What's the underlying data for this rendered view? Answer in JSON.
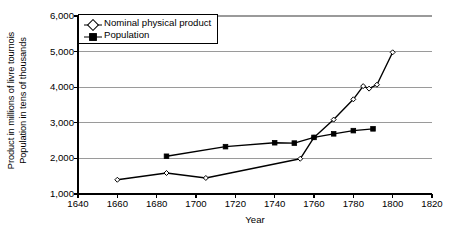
{
  "chart_data": {
    "type": "line",
    "title": "",
    "xlabel": "Year",
    "ylabel": "Product in millions of livre tournois / Population in tens of thousands",
    "ylabel_lines": [
      "Product in millions of livre tournois",
      "Population in tens of thousands"
    ],
    "xlim": [
      1640,
      1820
    ],
    "ylim": [
      1000,
      6000
    ],
    "xticks": [
      1640,
      1660,
      1680,
      1700,
      1720,
      1740,
      1760,
      1780,
      1800,
      1820
    ],
    "xtick_labels": [
      "1640",
      "1660",
      "1680",
      "1700",
      "1720",
      "1740",
      "1760",
      "1780",
      "1800",
      "1820"
    ],
    "yticks": [
      1000,
      2000,
      3000,
      4000,
      5000,
      6000
    ],
    "ytick_labels": [
      "1,000",
      "2,000",
      "3,000",
      "4,000",
      "5,000",
      "6,000"
    ],
    "grid": "horizontal",
    "legend_position": "top-left",
    "series": [
      {
        "name": "Nominal physical product",
        "marker": "open-diamond",
        "color": "#000000",
        "points": [
          {
            "x": 1660,
            "y": 1400
          },
          {
            "x": 1685,
            "y": 1590
          },
          {
            "x": 1705,
            "y": 1450
          },
          {
            "x": 1753,
            "y": 1990
          },
          {
            "x": 1760,
            "y": 2590
          },
          {
            "x": 1770,
            "y": 3090
          },
          {
            "x": 1780,
            "y": 3660
          },
          {
            "x": 1785,
            "y": 4030
          },
          {
            "x": 1788,
            "y": 3960
          },
          {
            "x": 1792,
            "y": 4070
          },
          {
            "x": 1800,
            "y": 4980
          }
        ]
      },
      {
        "name": "Population",
        "marker": "filled-square",
        "color": "#000000",
        "points": [
          {
            "x": 1685,
            "y": 2060
          },
          {
            "x": 1715,
            "y": 2330
          },
          {
            "x": 1740,
            "y": 2440
          },
          {
            "x": 1750,
            "y": 2430
          },
          {
            "x": 1760,
            "y": 2590
          },
          {
            "x": 1770,
            "y": 2690
          },
          {
            "x": 1780,
            "y": 2780
          },
          {
            "x": 1790,
            "y": 2830
          }
        ]
      }
    ]
  },
  "legend": {
    "items": [
      {
        "label": "Nominal physical product"
      },
      {
        "label": "Population"
      }
    ]
  },
  "axes": {
    "x_title": "Year"
  },
  "colors": {
    "axis": "#000000",
    "grid": "#9a9a9a",
    "series": "#000000",
    "background": "#ffffff"
  }
}
